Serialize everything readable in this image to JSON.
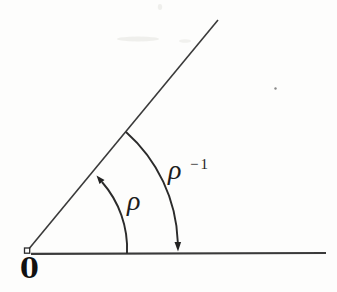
{
  "figure": {
    "vertex_label": "0",
    "inner_arc_label": "ρ",
    "outer_arc_label": {
      "base": "ρ",
      "superscript": "−1"
    },
    "colors": {
      "ink": "#2b2b2b",
      "background": "#fdfdfc"
    }
  }
}
